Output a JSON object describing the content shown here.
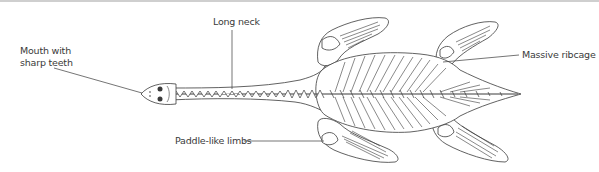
{
  "diagram": {
    "colors": {
      "line": "#3a3a3a",
      "fill": "#ffffff",
      "label_text": "#3a3a3a",
      "top_border": "#cfcfcf"
    },
    "labels": {
      "mouth": "Mouth with sharp teeth",
      "neck": "Long neck",
      "ribcage": "Massive ribcage",
      "limbs": "Paddle-like limbs"
    }
  }
}
